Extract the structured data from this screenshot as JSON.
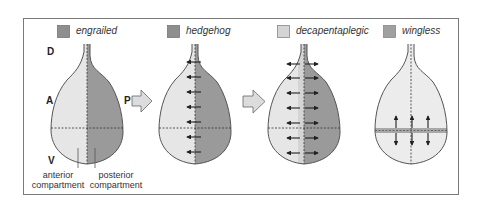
{
  "legend": [
    {
      "label": "engrailed",
      "color": "#8e8e8e"
    },
    {
      "label": "hedgehog",
      "color": "#8e8e8e"
    },
    {
      "label": "decapentaplegic",
      "color": "#d4d4d4"
    },
    {
      "label": "wingless",
      "color": "#a0a0a0"
    }
  ],
  "axis_labels": {
    "dorsal": "D",
    "ventral": "V",
    "anterior": "A",
    "posterior": "P"
  },
  "compartments": {
    "anterior": [
      "anterior",
      "compartment"
    ],
    "posterior": [
      "posterior",
      "compartment"
    ]
  },
  "colors": {
    "frame": "#7a7a7a",
    "outline": "#555555",
    "anterior_fill": "#e6e6e6",
    "posterior_fill": "#9a9a9a",
    "dpp_stripe": "#d4d4d4",
    "wg_stripe": "#a8a8a8",
    "block_arrow_fill": "#dcdcdc",
    "signal_arrow": "#222222"
  },
  "panels": [
    {
      "id": "engrailed",
      "signals": "none"
    },
    {
      "id": "hedgehog",
      "signals": "anterior-pointing arrows along AP boundary",
      "arrow_count": 7
    },
    {
      "id": "decapentaplegic",
      "signals": "bidirectional arrows from AP stripe",
      "arrow_count": 7
    },
    {
      "id": "wingless",
      "signals": "vertical bidirectional arrows from DV stripe",
      "arrow_count": 3
    }
  ]
}
